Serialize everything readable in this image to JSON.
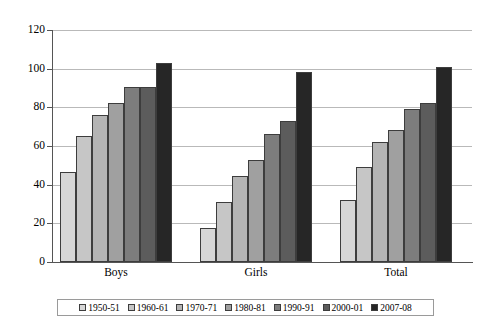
{
  "chart_data": {
    "type": "bar",
    "title": "",
    "xlabel": "",
    "ylabel": "",
    "ylim": [
      0,
      120
    ],
    "yticks": [
      0,
      20,
      40,
      60,
      80,
      100,
      120
    ],
    "grid": true,
    "legend_position": "bottom",
    "categories": [
      "Boys",
      "Girls",
      "Total"
    ],
    "series": [
      {
        "name": "1950-51",
        "color": "#d6d6d6",
        "values": [
          46.4,
          17.7,
          32.3
        ]
      },
      {
        "name": "1960-61",
        "color": "#c6c6c6",
        "values": [
          65.2,
          30.9,
          48.9
        ]
      },
      {
        "name": "1970-71",
        "color": "#b4b4b4",
        "values": [
          75.8,
          44.6,
          62.2
        ]
      },
      {
        "name": "1980-81",
        "color": "#a0a0a0",
        "values": [
          82.5,
          52.6,
          68.1
        ]
      },
      {
        "name": "1990-91",
        "color": "#7d7d7d",
        "values": [
          90.6,
          66.1,
          79.0
        ]
      },
      {
        "name": "2000-01",
        "color": "#5c5c5c",
        "values": [
          90.7,
          72.8,
          82.0
        ]
      },
      {
        "name": "2007-08",
        "color": "#262626",
        "values": [
          102.7,
          98.5,
          100.9
        ]
      }
    ]
  },
  "axis": {
    "tick_labels": [
      "120",
      "100",
      "80",
      "60",
      "40",
      "20",
      "0"
    ]
  },
  "legend": {
    "items": [
      "1950-51",
      "1960-61",
      "1970-71",
      "1980-81",
      "1990-91",
      "2000-01",
      "2007-08"
    ]
  }
}
